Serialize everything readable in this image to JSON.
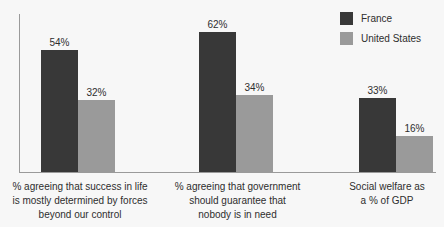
{
  "chart_data": {
    "type": "bar",
    "title": "",
    "subtitle": "",
    "xlabel": "",
    "ylabel": "",
    "ylim": [
      0,
      70
    ],
    "grid": false,
    "legend_position": "top-right",
    "value_suffix": "%",
    "categories": [
      "% agreeing that success in life is mostly determined by forces beyond our control",
      "% agreeing that government should guarantee that nobody is in need",
      "Social welfare as a % of GDP"
    ],
    "category_lines": [
      [
        "% agreeing that success in life",
        "is mostly determined by forces",
        "beyond our control"
      ],
      [
        "% agreeing that government",
        "should guarantee that",
        "nobody is in need"
      ],
      [
        "Social welfare as",
        "a % of GDP"
      ]
    ],
    "series": [
      {
        "name": "France",
        "color": "#383838",
        "values": [
          54,
          62,
          33
        ],
        "labels": [
          "54%",
          "62%",
          "33%"
        ]
      },
      {
        "name": "United States",
        "color": "#9a9a9a",
        "values": [
          32,
          34,
          16
        ],
        "labels": [
          "32%",
          "34%",
          "16%"
        ]
      }
    ]
  },
  "legend": {
    "items": [
      {
        "label": "France",
        "color": "#383838"
      },
      {
        "label": "United States",
        "color": "#9a9a9a"
      }
    ]
  },
  "colors": {
    "background": "#f7f7f7",
    "axis": "#9a9a9a",
    "text": "#2e2e2e",
    "france": "#383838",
    "united_states": "#9a9a9a"
  }
}
